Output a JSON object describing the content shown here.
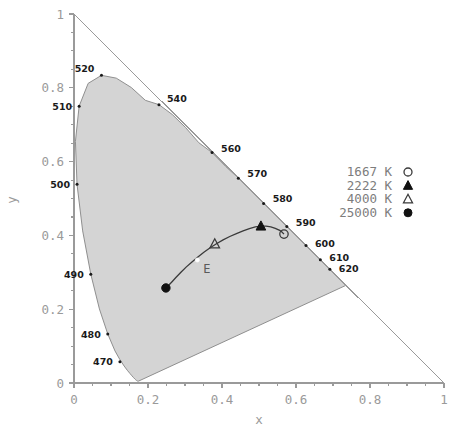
{
  "chart_data": {
    "type": "scatter",
    "title": "",
    "xlabel": "x",
    "ylabel": "y",
    "xlim": [
      0,
      1
    ],
    "ylim": [
      0,
      1
    ],
    "grid": false,
    "legend_position": "right",
    "xticks": [
      "0",
      "0.2",
      "0.4",
      "0.6",
      "0.8",
      "1"
    ],
    "xtick_values": [
      0,
      0.2,
      0.4,
      0.6,
      0.8,
      1
    ],
    "yticks": [
      "0",
      "0.2",
      "0.4",
      "0.6",
      "0.8",
      "1"
    ],
    "ytick_values": [
      0,
      0.2,
      0.4,
      0.6,
      0.8,
      1
    ],
    "series": [
      {
        "name": "1667 K",
        "marker": "open-circle",
        "x": [
          0.5675
        ],
        "y": [
          0.4035
        ]
      },
      {
        "name": "2222 K",
        "marker": "filled-triangle",
        "x": [
          0.5052
        ],
        "y": [
          0.4251
        ]
      },
      {
        "name": "4000 K",
        "marker": "open-triangle",
        "x": [
          0.3804
        ],
        "y": [
          0.3768
        ]
      },
      {
        "name": "25000 K",
        "marker": "filled-circle",
        "x": [
          0.2484
        ],
        "y": [
          0.2576
        ]
      }
    ],
    "annotations": [
      {
        "label": "E",
        "x": 0.3333,
        "y": 0.3333,
        "marker": "white-dot"
      }
    ],
    "spectral_locus_labels": [
      {
        "label": "470",
        "x": 0.1241,
        "y": 0.0578
      },
      {
        "label": "480",
        "x": 0.0913,
        "y": 0.1327
      },
      {
        "label": "490",
        "x": 0.0454,
        "y": 0.295
      },
      {
        "label": "500",
        "x": 0.0082,
        "y": 0.5384
      },
      {
        "label": "510",
        "x": 0.0139,
        "y": 0.7502
      },
      {
        "label": "520",
        "x": 0.0743,
        "y": 0.8338
      },
      {
        "label": "540",
        "x": 0.2296,
        "y": 0.7543
      },
      {
        "label": "560",
        "x": 0.3731,
        "y": 0.6245
      },
      {
        "label": "570",
        "x": 0.4441,
        "y": 0.5547
      },
      {
        "label": "580",
        "x": 0.5125,
        "y": 0.4866
      },
      {
        "label": "590",
        "x": 0.5752,
        "y": 0.4242
      },
      {
        "label": "600",
        "x": 0.627,
        "y": 0.3725
      },
      {
        "label": "610",
        "x": 0.6658,
        "y": 0.334
      },
      {
        "label": "620",
        "x": 0.6915,
        "y": 0.3083
      }
    ]
  },
  "legend": {
    "entries": [
      {
        "label": "1667 K",
        "marker": "open-circle"
      },
      {
        "label": "2222 K",
        "marker": "filled-triangle"
      },
      {
        "label": "4000 K",
        "marker": "open-triangle"
      },
      {
        "label": "25000 K",
        "marker": "filled-circle"
      }
    ]
  },
  "axes": {
    "x_title": "x",
    "y_title": "y",
    "x_tick_0": "0",
    "x_tick_1": "0.2",
    "x_tick_2": "0.4",
    "x_tick_3": "0.6",
    "x_tick_4": "0.8",
    "x_tick_5": "1",
    "y_tick_0": "0",
    "y_tick_1": "0.2",
    "y_tick_2": "0.4",
    "y_tick_3": "0.6",
    "y_tick_4": "0.8",
    "y_tick_5": "1"
  },
  "labels": {
    "white_point": "E"
  },
  "colors": {
    "gamut_fill": "#d4d4d4",
    "gamut_stroke": "#8f8f8f",
    "axis": "#9a9a9a",
    "tick_text": "#9a9a9a",
    "wavelength_text": "#1a1a1a",
    "locus_curve": "#3a3a3a",
    "legend_text": "#7d7d7d"
  }
}
